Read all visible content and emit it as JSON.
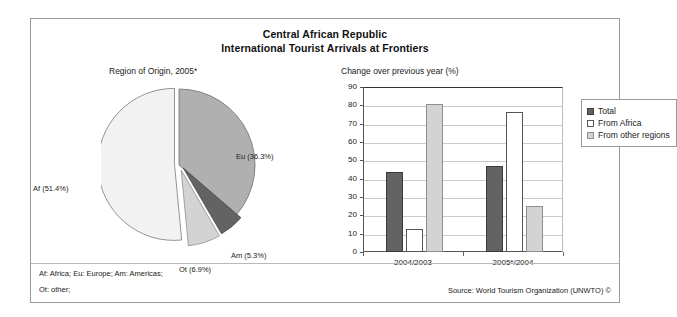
{
  "title": {
    "line1": "Central African Republic",
    "line2": "International Tourist Arrivals at Frontiers"
  },
  "pie_panel": {
    "caption": "Region of Origin, 2005*",
    "labels": {
      "eu": "Eu (36.3%)",
      "af": "Af (51.4%)",
      "am": "Am (5.3%)",
      "ot": "Ot (6.9%)"
    }
  },
  "bar_panel": {
    "caption": "Change over previous year (%)",
    "legend": [
      {
        "label": "Total",
        "swatch": "total"
      },
      {
        "label": "From Africa",
        "swatch": "africa"
      },
      {
        "label": "From other regions",
        "swatch": "other"
      }
    ],
    "yticks": [
      "90",
      "80",
      "70",
      "60",
      "50",
      "40",
      "30",
      "20",
      "10",
      "0"
    ],
    "categories": [
      "2004/2003",
      "2005*/2004"
    ]
  },
  "footer": {
    "note_line1": "Af: Africa; Eu: Europe; Am: Americas;",
    "note_line2": "Ot: other;",
    "source": "Source: World Tourism Organization (UNWTO) ©"
  },
  "colors": {
    "total": "#636363",
    "africa": "#ffffff",
    "other": "#d3d3d3",
    "pie_eu": "#b0b0b0",
    "pie_af": "#f2f2f2",
    "pie_am": "#636363",
    "pie_ot": "#d3d3d3",
    "frame": "#9a9a9a",
    "grid": "#c9c9c9"
  },
  "chart_data": [
    {
      "type": "pie",
      "title": "Region of Origin, 2005*",
      "categories": [
        "Eu",
        "Af",
        "Am",
        "Ot"
      ],
      "labels": [
        "Eu (36.3%)",
        "Af (51.4%)",
        "Am (5.3%)",
        "Ot (6.9%)"
      ],
      "values": [
        36.3,
        51.4,
        5.3,
        6.9
      ],
      "units": "percent",
      "legend": "none (labels placed around slices)",
      "notes": "Af: Africa; Eu: Europe; Am: Americas; Ot: other"
    },
    {
      "type": "bar",
      "title": "Change over previous year (%)",
      "xlabel": "",
      "ylabel": "",
      "ylim": [
        0,
        90
      ],
      "ytick_step": 10,
      "grid": true,
      "legend_position": "right",
      "categories": [
        "2004/2003",
        "2005*/2004"
      ],
      "series": [
        {
          "name": "Total",
          "values": [
            43.5,
            47.0
          ]
        },
        {
          "name": "From Africa",
          "values": [
            12.5,
            76.5
          ]
        },
        {
          "name": "From other regions",
          "values": [
            81.0,
            25.0
          ]
        }
      ]
    }
  ]
}
